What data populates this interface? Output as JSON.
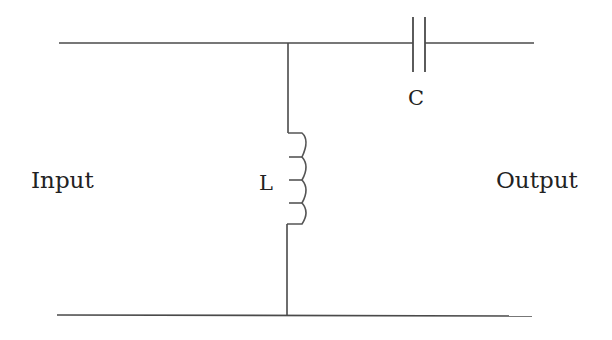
{
  "diagram": {
    "type": "circuit-schematic",
    "labels": {
      "input": "Input",
      "output": "Output",
      "capacitor": "C",
      "inductor": "L"
    },
    "components": [
      {
        "id": "capacitor",
        "kind": "capacitor",
        "label": "C",
        "connection": "series",
        "line": "top"
      },
      {
        "id": "inductor",
        "kind": "inductor",
        "label": "L",
        "connection": "shunt",
        "between": [
          "top",
          "bottom"
        ],
        "turns": 4
      }
    ],
    "ports": [
      {
        "id": "input",
        "label": "Input",
        "side": "left"
      },
      {
        "id": "output",
        "label": "Output",
        "side": "right"
      }
    ],
    "colors": {
      "line": "#4a4a4a",
      "text": "#222222",
      "background": "#ffffff"
    }
  }
}
